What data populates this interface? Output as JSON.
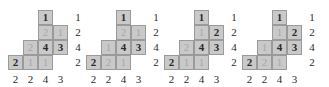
{
  "figure": {
    "grid": {
      "rows": 4,
      "cols": 4,
      "cell_px": 15
    },
    "colors": {
      "cell_fill": "#c9c9c9",
      "cell_border": "#9a9a9a",
      "entry_bold": "#2b2b2b",
      "entry_light": "#a8a8a8",
      "label": "#2b2b2b",
      "background": "#ffffff"
    },
    "shape_cells": [
      {
        "row": 0,
        "col": 2
      },
      {
        "row": 1,
        "col": 2
      },
      {
        "row": 1,
        "col": 3
      },
      {
        "row": 2,
        "col": 1
      },
      {
        "row": 2,
        "col": 2
      },
      {
        "row": 2,
        "col": 3
      },
      {
        "row": 3,
        "col": 0
      },
      {
        "row": 3,
        "col": 1
      },
      {
        "row": 3,
        "col": 2
      }
    ],
    "row_labels": [
      "1",
      "2",
      "4",
      "2"
    ],
    "column_labels": [
      "2",
      "2",
      "4",
      "3"
    ],
    "diagrams": [
      {
        "name": "diagram-1",
        "entries": [
          {
            "row": 0,
            "col": 2,
            "value": "1",
            "bold": true
          },
          {
            "row": 1,
            "col": 2,
            "value": "2",
            "bold": false
          },
          {
            "row": 1,
            "col": 3,
            "value": "1",
            "bold": false
          },
          {
            "row": 2,
            "col": 1,
            "value": "2",
            "bold": false
          },
          {
            "row": 2,
            "col": 2,
            "value": "4",
            "bold": true
          },
          {
            "row": 2,
            "col": 3,
            "value": "3",
            "bold": true
          },
          {
            "row": 3,
            "col": 0,
            "value": "2",
            "bold": true
          },
          {
            "row": 3,
            "col": 1,
            "value": "1",
            "bold": false
          },
          {
            "row": 3,
            "col": 2,
            "value": "1",
            "bold": false
          }
        ]
      },
      {
        "name": "diagram-2",
        "entries": [
          {
            "row": 0,
            "col": 2,
            "value": "1",
            "bold": true
          },
          {
            "row": 1,
            "col": 2,
            "value": "2",
            "bold": false
          },
          {
            "row": 1,
            "col": 3,
            "value": "1",
            "bold": false
          },
          {
            "row": 2,
            "col": 1,
            "value": "1",
            "bold": false
          },
          {
            "row": 2,
            "col": 2,
            "value": "4",
            "bold": true
          },
          {
            "row": 2,
            "col": 3,
            "value": "3",
            "bold": true
          },
          {
            "row": 3,
            "col": 0,
            "value": "2",
            "bold": true
          },
          {
            "row": 3,
            "col": 1,
            "value": "2",
            "bold": false
          },
          {
            "row": 3,
            "col": 2,
            "value": "1",
            "bold": false
          }
        ]
      },
      {
        "name": "diagram-3",
        "entries": [
          {
            "row": 0,
            "col": 2,
            "value": "1",
            "bold": true
          },
          {
            "row": 1,
            "col": 2,
            "value": "1",
            "bold": false
          },
          {
            "row": 1,
            "col": 3,
            "value": "2",
            "bold": true
          },
          {
            "row": 2,
            "col": 1,
            "value": "2",
            "bold": false
          },
          {
            "row": 2,
            "col": 2,
            "value": "4",
            "bold": true
          },
          {
            "row": 2,
            "col": 3,
            "value": "3",
            "bold": true
          },
          {
            "row": 3,
            "col": 0,
            "value": "2",
            "bold": true
          },
          {
            "row": 3,
            "col": 1,
            "value": "1",
            "bold": false
          },
          {
            "row": 3,
            "col": 2,
            "value": "1",
            "bold": false
          }
        ]
      },
      {
        "name": "diagram-4",
        "entries": [
          {
            "row": 0,
            "col": 2,
            "value": "1",
            "bold": true
          },
          {
            "row": 1,
            "col": 2,
            "value": "1",
            "bold": false
          },
          {
            "row": 1,
            "col": 3,
            "value": "2",
            "bold": true
          },
          {
            "row": 2,
            "col": 1,
            "value": "1",
            "bold": false
          },
          {
            "row": 2,
            "col": 2,
            "value": "4",
            "bold": true
          },
          {
            "row": 2,
            "col": 3,
            "value": "3",
            "bold": true
          },
          {
            "row": 3,
            "col": 0,
            "value": "2",
            "bold": true
          },
          {
            "row": 3,
            "col": 1,
            "value": "2",
            "bold": false
          },
          {
            "row": 3,
            "col": 2,
            "value": "1",
            "bold": false
          }
        ]
      }
    ]
  }
}
